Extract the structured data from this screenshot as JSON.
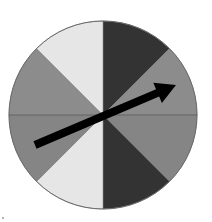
{
  "figure": {
    "title": ""
  },
  "spinner": {
    "sections": [
      {
        "index": 0,
        "shade": "dark",
        "color": "#333333"
      },
      {
        "index": 1,
        "shade": "medium",
        "color": "#8c8c8c"
      },
      {
        "index": 2,
        "shade": "medium",
        "color": "#858585"
      },
      {
        "index": 3,
        "shade": "dark",
        "color": "#333333"
      },
      {
        "index": 4,
        "shade": "light",
        "color": "#e6e6e6"
      },
      {
        "index": 5,
        "shade": "medium",
        "color": "#858585"
      },
      {
        "index": 6,
        "shade": "medium",
        "color": "#8c8c8c"
      },
      {
        "index": 7,
        "shade": "light",
        "color": "#e6e6e6"
      }
    ],
    "section_count": 8,
    "outline_color": "#6a6a6a",
    "arrow": {
      "icon": "arrow-pointer-icon",
      "color": "#000000",
      "direction_degrees_from_north_clockwise": 67
    }
  }
}
